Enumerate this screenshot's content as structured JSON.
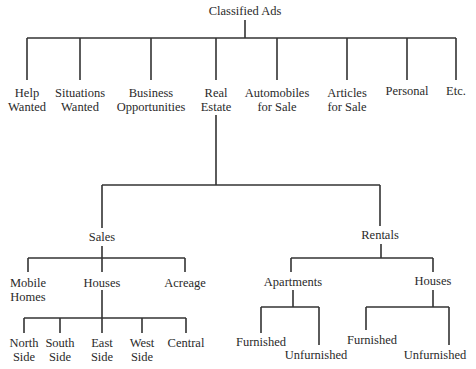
{
  "root": {
    "label": "Classified Ads"
  },
  "categories": [
    {
      "line1": "Help",
      "line2": "Wanted"
    },
    {
      "line1": "Situations",
      "line2": "Wanted"
    },
    {
      "line1": "Business",
      "line2": "Opportunities"
    },
    {
      "line1": "Real",
      "line2": "Estate"
    },
    {
      "line1": "Automobiles",
      "line2": "for Sale"
    },
    {
      "line1": "Articles",
      "line2": "for Sale"
    },
    {
      "line1": "Personal",
      "line2": ""
    },
    {
      "line1": "Etc.",
      "line2": ""
    }
  ],
  "real_estate": {
    "sales": {
      "label": "Sales",
      "children": [
        {
          "line1": "Mobile",
          "line2": "Homes"
        },
        {
          "line1": "Houses",
          "line2": ""
        },
        {
          "line1": "Acreage",
          "line2": ""
        }
      ],
      "houses_children": [
        {
          "line1": "North",
          "line2": "Side"
        },
        {
          "line1": "South",
          "line2": "Side"
        },
        {
          "line1": "East",
          "line2": "Side"
        },
        {
          "line1": "West",
          "line2": "Side"
        },
        {
          "line1": "Central",
          "line2": ""
        }
      ]
    },
    "rentals": {
      "label": "Rentals",
      "apartments": {
        "label": "Apartments",
        "children": [
          "Furnished",
          "Unfurnished"
        ]
      },
      "houses": {
        "label": "Houses",
        "children": [
          "Furnished",
          "Unfurnished"
        ]
      }
    }
  }
}
